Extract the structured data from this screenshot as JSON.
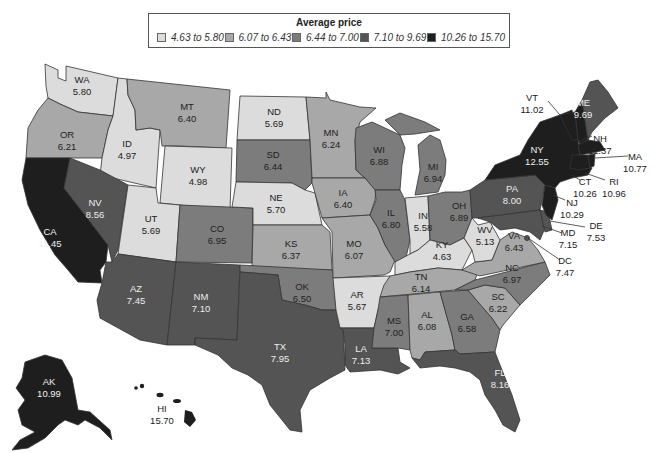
{
  "legend": {
    "title": "Average price",
    "bins": [
      {
        "label": "4.63 to 5.80",
        "color": "#dcdcdc"
      },
      {
        "label": "6.07 to 6.43",
        "color": "#a8a8a8"
      },
      {
        "label": "6.44 to 7.00",
        "color": "#7c7c7c"
      },
      {
        "label": "7.10 to 9.69",
        "color": "#545454"
      },
      {
        "label": "10.26 to 15.70",
        "color": "#1e1e1e"
      }
    ]
  },
  "states": {
    "WA": {
      "abbr": "WA",
      "value": "5.80"
    },
    "OR": {
      "abbr": "OR",
      "value": "6.21"
    },
    "CA": {
      "abbr": "CA",
      "value": "11.45"
    },
    "ID": {
      "abbr": "ID",
      "value": "4.97"
    },
    "NV": {
      "abbr": "NV",
      "value": "8.56"
    },
    "MT": {
      "abbr": "MT",
      "value": "6.40"
    },
    "WY": {
      "abbr": "WY",
      "value": "4.98"
    },
    "UT": {
      "abbr": "UT",
      "value": "5.69"
    },
    "AZ": {
      "abbr": "AZ",
      "value": "7.45"
    },
    "CO": {
      "abbr": "CO",
      "value": "6.95"
    },
    "NM": {
      "abbr": "NM",
      "value": "7.10"
    },
    "ND": {
      "abbr": "ND",
      "value": "5.69"
    },
    "SD": {
      "abbr": "SD",
      "value": "6.44"
    },
    "NE": {
      "abbr": "NE",
      "value": "5.70"
    },
    "KS": {
      "abbr": "KS",
      "value": "6.37"
    },
    "OK": {
      "abbr": "OK",
      "value": "6.50"
    },
    "TX": {
      "abbr": "TX",
      "value": "7.95"
    },
    "MN": {
      "abbr": "MN",
      "value": "6.24"
    },
    "IA": {
      "abbr": "IA",
      "value": "6.40"
    },
    "MO": {
      "abbr": "MO",
      "value": "6.07"
    },
    "AR": {
      "abbr": "AR",
      "value": "5.67"
    },
    "LA": {
      "abbr": "LA",
      "value": "7.13"
    },
    "WI": {
      "abbr": "WI",
      "value": "6.88"
    },
    "IL": {
      "abbr": "IL",
      "value": "6.80"
    },
    "MI": {
      "abbr": "MI",
      "value": "6.94"
    },
    "IN": {
      "abbr": "IN",
      "value": "5.58"
    },
    "OH": {
      "abbr": "OH",
      "value": "6.89"
    },
    "KY": {
      "abbr": "KY",
      "value": "4.63"
    },
    "TN": {
      "abbr": "TN",
      "value": "6.14"
    },
    "MS": {
      "abbr": "MS",
      "value": "7.00"
    },
    "AL": {
      "abbr": "AL",
      "value": "6.08"
    },
    "GA": {
      "abbr": "GA",
      "value": "6.58"
    },
    "FL": {
      "abbr": "FL",
      "value": "8.16"
    },
    "SC": {
      "abbr": "SC",
      "value": "6.22"
    },
    "NC": {
      "abbr": "NC",
      "value": "6.97"
    },
    "VA": {
      "abbr": "VA",
      "value": "6.43"
    },
    "WV": {
      "abbr": "WV",
      "value": "5.13"
    },
    "PA": {
      "abbr": "PA",
      "value": "8.00"
    },
    "NY": {
      "abbr": "NY",
      "value": "12.55"
    },
    "VT": {
      "abbr": "VT",
      "value": "11.02"
    },
    "NH": {
      "abbr": "NH",
      "value": "11.37"
    },
    "ME": {
      "abbr": "ME",
      "value": "9.69"
    },
    "MA": {
      "abbr": "MA",
      "value": "10.77"
    },
    "RI": {
      "abbr": "RI",
      "value": "10.96"
    },
    "CT": {
      "abbr": "CT",
      "value": "10.26"
    },
    "NJ": {
      "abbr": "NJ",
      "value": "10.29"
    },
    "DE": {
      "abbr": "DE",
      "value": "7.53"
    },
    "MD": {
      "abbr": "MD",
      "value": "7.15"
    },
    "DC": {
      "abbr": "DC",
      "value": "7.47"
    },
    "AK": {
      "abbr": "AK",
      "value": "10.99"
    },
    "HI": {
      "abbr": "HI",
      "value": "15.70"
    }
  }
}
